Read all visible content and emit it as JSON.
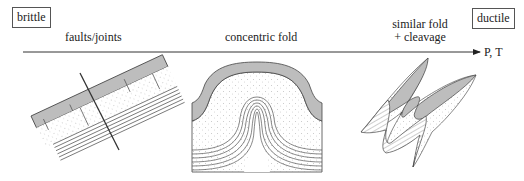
{
  "labels": {
    "left_box": "brittle",
    "right_box": "ductile",
    "axis": "P, T"
  },
  "stages": [
    {
      "id": "faults",
      "title": "faults/joints"
    },
    {
      "id": "concentric",
      "title": "concentric fold"
    },
    {
      "id": "similar",
      "title_line1": "similar fold",
      "title_line2": "+ cleavage"
    }
  ],
  "colors": {
    "line": "#333333",
    "grey_layer": "#bdbdbd",
    "stipple": "#888888",
    "background": "#ffffff"
  }
}
